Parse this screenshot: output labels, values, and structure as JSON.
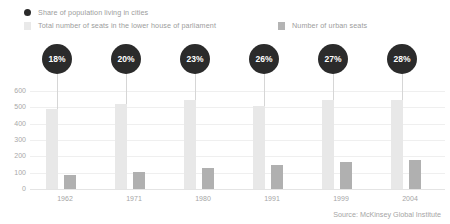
{
  "legend": {
    "items": [
      {
        "label": "Share of population living in cities",
        "marker": "circle-marker-icon",
        "color": "#2b2b2b"
      },
      {
        "label": "Total number of seats in the lower house of parliament",
        "marker": "square-marker-icon",
        "color": "#e9e9e9"
      },
      {
        "label": "Number of urban seats",
        "marker": "square-marker-icon",
        "color": "#b4b4b4"
      }
    ]
  },
  "source": "Source: McKinsey Global Institute",
  "chart_data": {
    "type": "bar",
    "title": "",
    "subtitle": "",
    "xlabel": "",
    "ylabel": "",
    "categories": [
      "1962",
      "1971",
      "1980",
      "1991",
      "1999",
      "2004"
    ],
    "ylim": [
      0,
      600
    ],
    "yticks": [
      0,
      100,
      200,
      300,
      400,
      500,
      600
    ],
    "ytick_labels": [
      "0",
      "100",
      "200",
      "300",
      "400",
      "500",
      "600"
    ],
    "grid": true,
    "legend_position": "top-left",
    "series": [
      {
        "name": "Total number of seats in the lower house of parliament",
        "color": "#e8e8e8",
        "values": [
          490,
          520,
          545,
          510,
          545,
          545
        ]
      },
      {
        "name": "Number of urban seats",
        "color": "#b0b0b0",
        "values": [
          85,
          105,
          130,
          145,
          165,
          180
        ]
      }
    ],
    "annotations": {
      "name": "Share of population living in cities",
      "color": "#2b2b2b",
      "labels": [
        "18%",
        "20%",
        "23%",
        "26%",
        "27%",
        "28%"
      ],
      "values": [
        18,
        20,
        23,
        26,
        27,
        28
      ]
    }
  }
}
